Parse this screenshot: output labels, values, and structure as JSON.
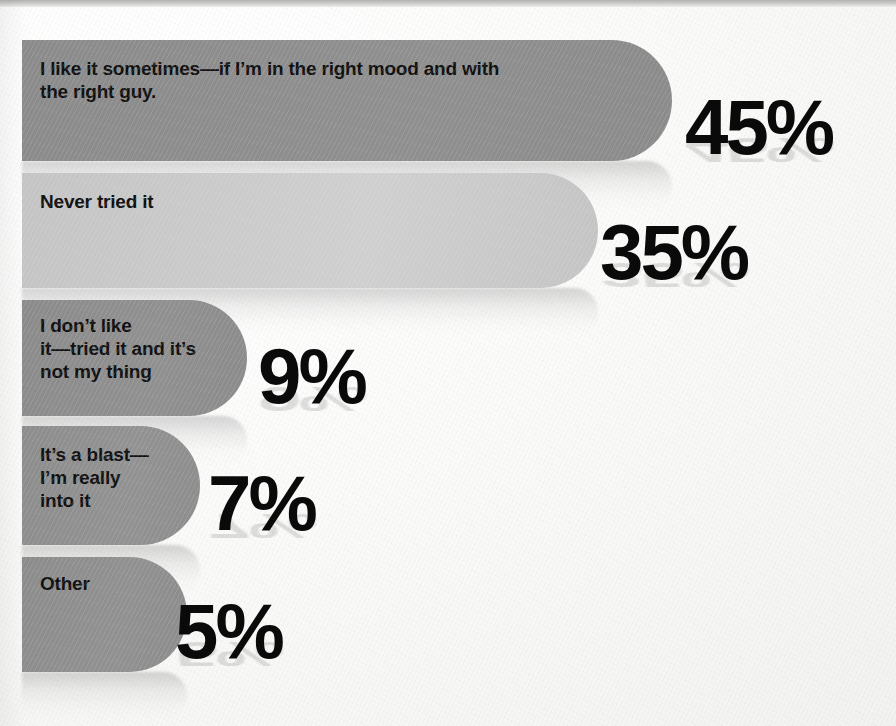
{
  "chart_data": {
    "type": "bar",
    "orientation": "horizontal",
    "title": "",
    "subtitle": "",
    "xlabel": "",
    "ylabel": "",
    "unit": "%",
    "grid": false,
    "legend": "none",
    "xlim": [
      0,
      50
    ],
    "categories": [
      "I like it sometimes—if I’m in the right mood and with\nthe right guy.",
      "Never tried it",
      "I don’t like\nit—tried it and it’s\nnot my thing",
      "It’s a blast—\nI’m really\ninto it",
      "Other"
    ],
    "values": [
      45,
      35,
      9,
      7,
      5
    ],
    "value_labels": [
      "45%",
      "35%",
      "9%",
      "7%",
      "5%"
    ]
  },
  "bars": [
    {
      "label": "I like it sometimes—if I’m in the right mood and with\nthe right guy.",
      "value": 45,
      "value_label": "45%",
      "color": "#8b8b8b",
      "color_end": "#8f8f8f",
      "left": 22,
      "top": 40,
      "width": 650,
      "height": 121,
      "label_left": 18,
      "label_top": 18,
      "label_size": 19,
      "pct_left": 685,
      "pct_top": 88,
      "pct_size": 78
    },
    {
      "label": "Never tried it",
      "value": 35,
      "value_label": "35%",
      "color": "#c4c4c4",
      "color_end": "#cfcfcf",
      "left": 22,
      "top": 173,
      "width": 576,
      "height": 115,
      "label_left": 18,
      "label_top": 18,
      "label_size": 19,
      "pct_left": 600,
      "pct_top": 213,
      "pct_size": 78
    },
    {
      "label": "I don’t like\nit—tried it and it’s\nnot my thing",
      "value": 9,
      "value_label": "9%",
      "color": "#8b8b8b",
      "color_end": "#909090",
      "left": 22,
      "top": 300,
      "width": 225,
      "height": 116,
      "label_left": 18,
      "label_top": 15,
      "label_size": 19,
      "pct_left": 258,
      "pct_top": 337,
      "pct_size": 78
    },
    {
      "label": "It’s a blast—\nI’m really\ninto it",
      "value": 7,
      "value_label": "7%",
      "color": "#8d8d8d",
      "color_end": "#929292",
      "left": 22,
      "top": 426,
      "width": 178,
      "height": 119,
      "label_left": 18,
      "label_top": 18,
      "label_size": 19,
      "pct_left": 208,
      "pct_top": 464,
      "pct_size": 78
    },
    {
      "label": "Other",
      "value": 5,
      "value_label": "5%",
      "color": "#8c8c8c",
      "color_end": "#919191",
      "left": 22,
      "top": 557,
      "width": 165,
      "height": 115,
      "label_left": 18,
      "label_top": 16,
      "label_size": 19,
      "pct_left": 175,
      "pct_top": 592,
      "pct_size": 78
    }
  ],
  "colors": {
    "background": "#f7f7f5",
    "bar_dark": "#8b8b8b",
    "bar_light": "#c4c4c4",
    "text": "#101010",
    "percent_text": "#0a0a0a"
  }
}
